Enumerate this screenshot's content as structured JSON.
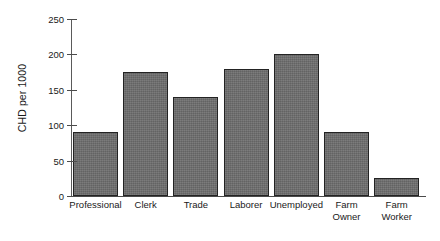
{
  "chart_data": {
    "type": "bar",
    "title": "",
    "xlabel": "",
    "ylabel": "CHD per 1000",
    "categories": [
      "Professional",
      "Clerk",
      "Trade",
      "Laborer",
      "Unemployed",
      "Farm\nOwner",
      "Farm\nWorker"
    ],
    "values": [
      90,
      175,
      140,
      180,
      200,
      90,
      25
    ],
    "ylim": [
      0,
      250
    ],
    "yticks": [
      0,
      50,
      100,
      150,
      200,
      250
    ],
    "ytick_labels": [
      "0",
      "50",
      "100",
      "150",
      "200",
      "250"
    ],
    "grid": false,
    "legend": false,
    "bar_color": "#6d6d6d",
    "bar_edge_color": "#232323",
    "axis_color": "#4a4a4a"
  },
  "axes": {
    "y_title": "CHD per 1000"
  }
}
